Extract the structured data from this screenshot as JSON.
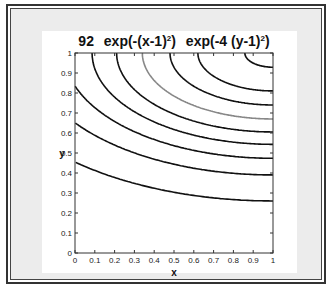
{
  "chart_data": {
    "type": "contour",
    "title_parts": {
      "prefix": "92",
      "f1": "exp(-(x-1)",
      "f1_exp": "2",
      "f1_close": ")",
      "f2": "exp(-4 (y-1)",
      "f2_exp": "2",
      "f2_close": ")"
    },
    "xlabel": "x",
    "ylabel": "y",
    "xlim": [
      0,
      1
    ],
    "ylim": [
      0,
      1
    ],
    "xticks": [
      "0",
      "0.1",
      "0.2",
      "0.3",
      "0.4",
      "0.5",
      "0.6",
      "0.7",
      "0.8",
      "0.9",
      "1"
    ],
    "yticks": [
      "0",
      "0.1",
      "0.2",
      "0.3",
      "0.4",
      "0.5",
      "0.6",
      "0.7",
      "0.8",
      "0.9",
      "1"
    ],
    "function": "exp(-(x-1)^2) * exp(-4*(y-1)^2)",
    "contours": [
      {
        "level": 0.98,
        "color": "#111111"
      },
      {
        "level": 0.866,
        "color": "#111111"
      },
      {
        "level": 0.763,
        "color": "#111111"
      },
      {
        "level": 0.647,
        "color": "#888888"
      },
      {
        "level": 0.536,
        "color": "#111111"
      },
      {
        "level": 0.434,
        "color": "#111111"
      },
      {
        "level": 0.33,
        "color": "#111111"
      },
      {
        "level": 0.226,
        "color": "#111111"
      },
      {
        "level": 0.112,
        "color": "#111111"
      }
    ],
    "grid": false,
    "legend": null
  }
}
